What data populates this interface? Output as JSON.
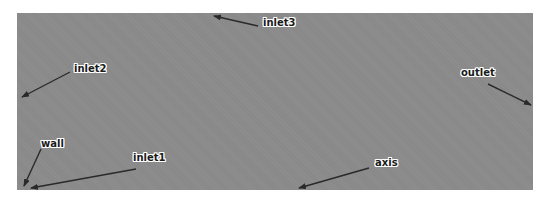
{
  "diagram": {
    "background_color": "#8b8b8b",
    "arrow_color": "#2a2a2a",
    "labels": [
      {
        "id": "inlet3",
        "text": "inlet3",
        "x": 262,
        "y": 17,
        "arrow": {
          "x1": 258,
          "y1": 26,
          "x2": 214,
          "y2": 16
        }
      },
      {
        "id": "inlet2",
        "text": "inlet2",
        "x": 73,
        "y": 63,
        "arrow": {
          "x1": 70,
          "y1": 72,
          "x2": 22,
          "y2": 97
        }
      },
      {
        "id": "outlet",
        "text": "outlet",
        "x": 460,
        "y": 67,
        "arrow": {
          "x1": 488,
          "y1": 84,
          "x2": 531,
          "y2": 105
        }
      },
      {
        "id": "wall",
        "text": "wall",
        "x": 40,
        "y": 138,
        "arrow": {
          "x1": 41,
          "y1": 149,
          "x2": 24,
          "y2": 186
        }
      },
      {
        "id": "inlet1",
        "text": "inlet1",
        "x": 132,
        "y": 152,
        "arrow": {
          "x1": 136,
          "y1": 169,
          "x2": 31,
          "y2": 188
        }
      },
      {
        "id": "axis",
        "text": "axis",
        "x": 374,
        "y": 157,
        "arrow": {
          "x1": 369,
          "y1": 168,
          "x2": 299,
          "y2": 188
        }
      }
    ]
  }
}
